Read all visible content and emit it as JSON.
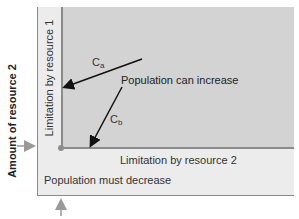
{
  "diagram": {
    "y_axis_label": "Amount of resource 2",
    "regions": {
      "limitation_resource_1": "Limitation by resource 1",
      "limitation_resource_2": "Limitation by resource 2",
      "increase": "Population can increase",
      "decrease": "Population must decrease"
    },
    "vectors": [
      {
        "name": "C",
        "subscript": "a",
        "direction": "toward resource 1 limit line"
      },
      {
        "name": "C",
        "subscript": "b",
        "direction": "toward resource 2 limit line"
      }
    ],
    "colors": {
      "increase_region": "#d3d3d3",
      "decrease_region": "#ececec",
      "boundary": "#8c8c8c",
      "marker_arrows": "#999999"
    }
  }
}
